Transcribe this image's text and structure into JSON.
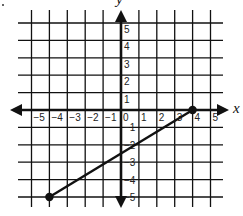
{
  "chart_data": {
    "type": "line",
    "title": "",
    "xlabel": "x",
    "ylabel": "y",
    "xlim": [
      -5,
      5
    ],
    "ylim": [
      -5,
      5
    ],
    "grid": true,
    "x_ticks": [
      -5,
      -4,
      -3,
      -2,
      -1,
      0,
      1,
      2,
      3,
      4,
      5
    ],
    "y_ticks": [
      -5,
      -4,
      -3,
      -2,
      -1,
      1,
      2,
      3,
      4,
      5
    ],
    "x_tick_labels": [
      "−5",
      "−4",
      "−3",
      "−2",
      "−1",
      "0",
      "1",
      "2",
      "3",
      "4",
      "5"
    ],
    "y_tick_labels": [
      "−5",
      "−4",
      "−3",
      "−2",
      "−1",
      "1",
      "2",
      "3",
      "4",
      "5"
    ],
    "series": [
      {
        "name": "segment",
        "points": [
          {
            "x": -4,
            "y": -5
          },
          {
            "x": 4,
            "y": 0
          }
        ],
        "endpoints": "closed-dots",
        "slope": 0.625,
        "y_intercept": -2.5
      }
    ],
    "colors": {
      "line": "#111111",
      "grid": "#111111",
      "background": "#ffffff"
    }
  }
}
